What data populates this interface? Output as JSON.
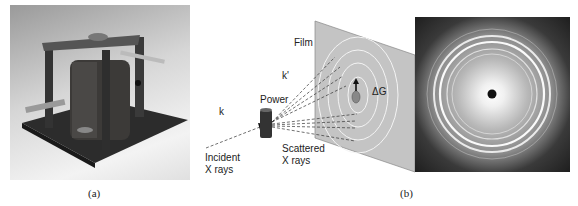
{
  "figure": {
    "panel_a": {
      "caption": "(a)",
      "description": "photograph of X-ray powder camera apparatus"
    },
    "panel_b": {
      "caption": "(b)",
      "diagram_labels": {
        "film": "Film",
        "k_prime": "k'",
        "k": "k",
        "power": "Power",
        "delta_g": "ΔG",
        "incident": [
          "Incident",
          "X rays"
        ],
        "scattered": [
          "Scattered",
          "X rays"
        ]
      },
      "photo_description": "powder diffraction ring pattern"
    }
  }
}
